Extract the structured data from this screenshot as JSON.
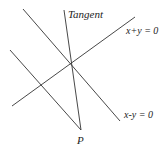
{
  "diagram": {
    "labels": {
      "tangent": "Tangent",
      "line1": "x+y = 0",
      "line2": "x-y = 0",
      "point": "P"
    },
    "colors": {
      "line": "#333333",
      "text": "#222222",
      "background": "#ffffff"
    }
  }
}
